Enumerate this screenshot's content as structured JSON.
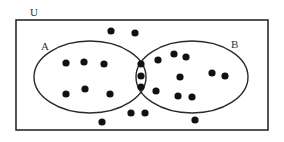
{
  "diagram": {
    "type": "venn",
    "universe_label": "U",
    "sets": [
      {
        "label": "A",
        "cx": 90,
        "cy": 78,
        "rx": 56,
        "ry": 37
      },
      {
        "label": "B",
        "cx": 192,
        "cy": 78,
        "rx": 56,
        "ry": 37
      }
    ],
    "region_counts": {
      "A_only": 6,
      "A_and_B": 3,
      "B_only": 9,
      "neither": 6,
      "total": 24
    },
    "colors": {
      "stroke": "#2a2a2a",
      "dot": "#111111",
      "background": "#ffffff"
    },
    "dots": {
      "neither": [
        [
          111,
          31
        ],
        [
          135,
          33
        ],
        [
          102,
          122
        ],
        [
          131,
          113
        ],
        [
          145,
          113
        ],
        [
          195,
          120
        ]
      ],
      "A_only": [
        [
          66,
          63
        ],
        [
          84,
          62
        ],
        [
          104,
          64
        ],
        [
          66,
          94
        ],
        [
          85,
          89
        ],
        [
          110,
          94
        ]
      ],
      "A_and_B": [
        [
          141,
          64
        ],
        [
          141,
          76
        ],
        [
          141,
          87
        ]
      ],
      "B_only": [
        [
          158,
          60
        ],
        [
          174,
          54
        ],
        [
          186,
          57
        ],
        [
          180,
          77
        ],
        [
          156,
          91
        ],
        [
          178,
          96
        ],
        [
          192,
          97
        ],
        [
          212,
          73
        ],
        [
          225,
          76
        ]
      ]
    }
  }
}
